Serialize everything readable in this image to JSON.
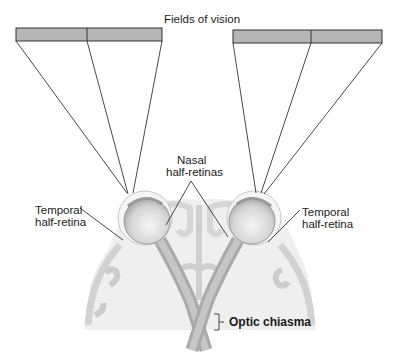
{
  "title": "Fields of vision",
  "labels": {
    "nasal": [
      "Nasal",
      "half-retinas"
    ],
    "temporal_left": [
      "Temporal",
      "half-retina"
    ],
    "temporal_right": [
      "Temporal",
      "half-retina"
    ],
    "optic_chiasma": "Optic chiasma"
  },
  "colors": {
    "field_fill": "#b5b5b5",
    "brain_fill": "#efefef",
    "brain_fold": "#cfcfcf",
    "nerve": "#b8b8b8",
    "eye": "#e2e2e2",
    "line": "#333333"
  },
  "fields": [
    {
      "side": "left",
      "segments": 2
    },
    {
      "side": "right",
      "segments": 2
    }
  ]
}
